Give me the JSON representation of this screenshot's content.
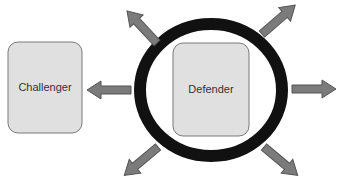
{
  "diagram": {
    "nodes": {
      "challenger": {
        "label": "Challenger"
      },
      "defender": {
        "label": "Defender"
      }
    },
    "arrows": [
      {
        "id": "to-challenger",
        "direction": "left"
      },
      {
        "id": "right",
        "direction": "right"
      },
      {
        "id": "upper-left",
        "direction": "up-left"
      },
      {
        "id": "upper-right",
        "direction": "up-right"
      },
      {
        "id": "lower-left",
        "direction": "down-left"
      },
      {
        "id": "lower-right",
        "direction": "down-right"
      }
    ],
    "colors": {
      "ring": "#111111",
      "box_fill": "#e0e0e0",
      "box_stroke": "#7a7a7a",
      "arrow_fill": "#7b7b7b",
      "arrow_stroke": "#555555",
      "text": "#333333"
    }
  }
}
